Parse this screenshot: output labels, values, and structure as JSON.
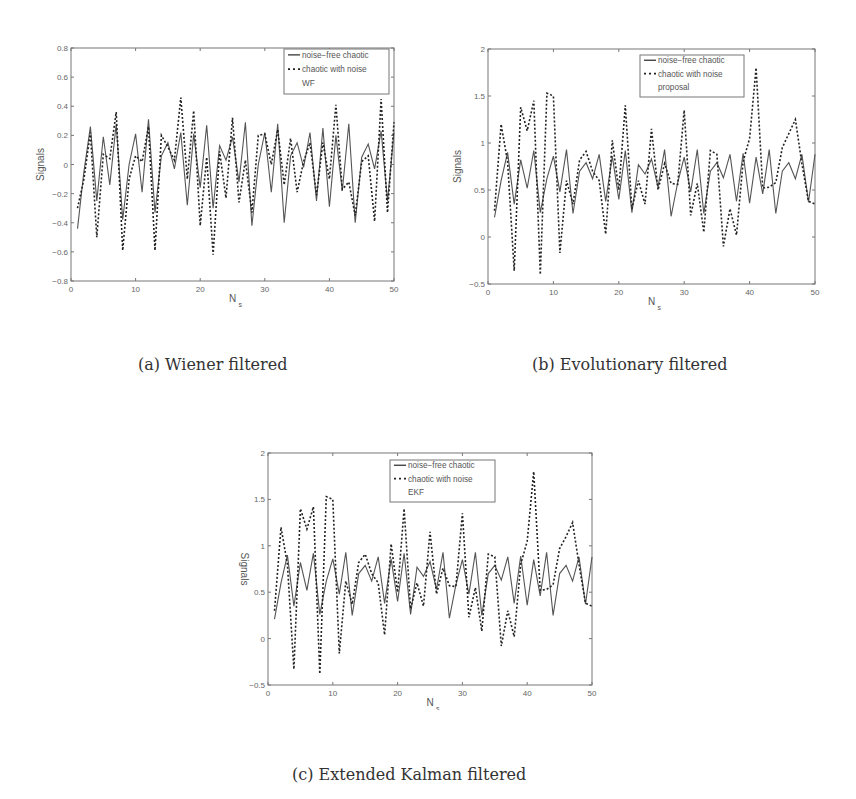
{
  "figure": {
    "captions": {
      "a": "(a) Wiener filtered",
      "b": "(b) Evolutionary filtered",
      "c": "(c) Extended Kalman filtered"
    }
  },
  "chart_data": [
    {
      "id": "a",
      "type": "line",
      "title": "",
      "xlabel": "N",
      "xlabel_sub": "s",
      "ylabel": "Signals",
      "xlim": [
        0,
        50
      ],
      "ylim": [
        -0.8,
        0.8
      ],
      "xticks": [
        0,
        10,
        20,
        30,
        40,
        50
      ],
      "yticks": [
        -0.8,
        -0.6,
        -0.4,
        -0.2,
        0,
        0.2,
        0.4,
        0.6,
        0.8
      ],
      "ytick_labels": [
        "−0.8",
        "−0.6",
        "−0.4",
        "−0.2",
        "0",
        "0.2",
        "0.4",
        "0.6",
        "0.8"
      ],
      "grid": false,
      "legend_position": "upper right",
      "legend": [
        "noise−free chaotic",
        "chaotic with noise",
        "WF"
      ],
      "x": [
        1,
        2,
        3,
        4,
        5,
        6,
        7,
        8,
        9,
        10,
        11,
        12,
        13,
        14,
        15,
        16,
        17,
        18,
        19,
        20,
        21,
        22,
        23,
        24,
        25,
        26,
        27,
        28,
        29,
        30,
        31,
        32,
        33,
        34,
        35,
        36,
        37,
        38,
        39,
        40,
        41,
        42,
        43,
        44,
        45,
        46,
        47,
        48,
        49,
        50
      ],
      "series": [
        {
          "name": "noise-free chaotic",
          "style": "solid",
          "values": [
            -0.44,
            -0.05,
            0.26,
            -0.25,
            0.19,
            -0.14,
            0.28,
            -0.38,
            0.0,
            0.21,
            -0.19,
            0.31,
            -0.33,
            0.06,
            0.15,
            -0.03,
            0.22,
            -0.28,
            0.21,
            -0.16,
            0.27,
            -0.3,
            0.13,
            0.03,
            0.19,
            -0.12,
            0.29,
            -0.42,
            0.0,
            0.22,
            -0.19,
            0.28,
            -0.4,
            0.06,
            0.15,
            -0.02,
            0.22,
            -0.25,
            0.25,
            -0.29,
            0.2,
            -0.18,
            0.28,
            -0.4,
            0.05,
            0.14,
            -0.03,
            0.23,
            -0.25,
            0.22
          ]
        },
        {
          "name": "chaotic with noise",
          "style": "dashed",
          "values": [
            -0.3,
            -0.1,
            0.22,
            -0.5,
            0.07,
            0.04,
            0.36,
            -0.59,
            -0.1,
            0.06,
            0.02,
            0.26,
            -0.59,
            0.2,
            0.12,
            0.03,
            0.46,
            -0.1,
            0.37,
            -0.42,
            0.05,
            -0.62,
            0.09,
            -0.23,
            0.32,
            -0.26,
            0.03,
            -0.33,
            0.2,
            0.21,
            0.0,
            0.24,
            -0.14,
            0.18,
            -0.19,
            0.02,
            0.15,
            -0.21,
            0.15,
            -0.1,
            0.41,
            -0.17,
            -0.12,
            -0.35,
            0.02,
            0.06,
            -0.39,
            0.45,
            -0.33,
            0.29
          ]
        }
      ]
    },
    {
      "id": "b",
      "type": "line",
      "title": "",
      "xlabel": "N",
      "xlabel_sub": "s",
      "ylabel": "Signals",
      "xlim": [
        0,
        50
      ],
      "ylim": [
        -0.5,
        2
      ],
      "xticks": [
        0,
        10,
        20,
        30,
        40,
        50
      ],
      "yticks": [
        -0.5,
        0,
        0.5,
        1,
        1.5,
        2
      ],
      "ytick_labels": [
        "−0.5",
        "0",
        "0.5",
        "1",
        "1.5",
        "2"
      ],
      "grid": false,
      "legend_position": "upper center-right",
      "legend": [
        "noise−free chaotic",
        "chaotic with noise",
        "proposal"
      ],
      "x": [
        1,
        2,
        3,
        4,
        5,
        6,
        7,
        8,
        9,
        10,
        11,
        12,
        13,
        14,
        15,
        16,
        17,
        18,
        19,
        20,
        21,
        22,
        23,
        24,
        25,
        26,
        27,
        28,
        29,
        30,
        31,
        32,
        33,
        34,
        35,
        36,
        37,
        38,
        39,
        40,
        41,
        42,
        43,
        44,
        45,
        46,
        47,
        48,
        49,
        50
      ],
      "series": [
        {
          "name": "noise-free chaotic",
          "style": "solid",
          "values": [
            0.21,
            0.6,
            0.9,
            0.35,
            0.82,
            0.52,
            0.92,
            0.26,
            0.62,
            0.86,
            0.48,
            0.93,
            0.25,
            0.7,
            0.79,
            0.62,
            0.88,
            0.38,
            0.86,
            0.4,
            0.92,
            0.26,
            0.77,
            0.67,
            0.83,
            0.53,
            0.93,
            0.22,
            0.58,
            0.85,
            0.48,
            0.93,
            0.25,
            0.7,
            0.79,
            0.63,
            0.88,
            0.38,
            0.89,
            0.36,
            0.85,
            0.46,
            0.93,
            0.25,
            0.7,
            0.79,
            0.62,
            0.88,
            0.37,
            0.88
          ]
        },
        {
          "name": "chaotic with noise",
          "style": "dashed",
          "values": [
            0.28,
            1.2,
            0.8,
            -0.36,
            1.38,
            1.13,
            1.45,
            -0.4,
            1.53,
            1.5,
            -0.17,
            0.6,
            0.35,
            0.82,
            0.91,
            0.7,
            0.6,
            0.03,
            1.03,
            0.5,
            1.4,
            0.3,
            0.6,
            0.35,
            1.15,
            0.5,
            0.78,
            0.57,
            0.56,
            1.35,
            0.23,
            0.57,
            0.05,
            0.92,
            0.88,
            -0.1,
            0.3,
            0.02,
            0.8,
            1.05,
            1.8,
            0.52,
            0.53,
            0.58,
            0.95,
            1.1,
            1.25,
            0.78,
            0.38,
            0.35
          ]
        }
      ]
    },
    {
      "id": "c",
      "type": "line",
      "title": "",
      "xlabel": "N",
      "xlabel_sub": "s",
      "ylabel": "Signals",
      "xlim": [
        0,
        50
      ],
      "ylim": [
        -0.5,
        2
      ],
      "xticks": [
        0,
        10,
        20,
        30,
        40,
        50
      ],
      "yticks": [
        -0.5,
        0,
        0.5,
        1,
        1.5,
        2
      ],
      "ytick_labels": [
        "−0.5",
        "0",
        "0.5",
        "1",
        "1.5",
        "2"
      ],
      "grid": false,
      "legend_position": "upper center-right",
      "legend": [
        "noise−free chaotic",
        "chaotic with noise",
        "EKF"
      ],
      "x": [
        1,
        2,
        3,
        4,
        5,
        6,
        7,
        8,
        9,
        10,
        11,
        12,
        13,
        14,
        15,
        16,
        17,
        18,
        19,
        20,
        21,
        22,
        23,
        24,
        25,
        26,
        27,
        28,
        29,
        30,
        31,
        32,
        33,
        34,
        35,
        36,
        37,
        38,
        39,
        40,
        41,
        42,
        43,
        44,
        45,
        46,
        47,
        48,
        49,
        50
      ],
      "series": [
        {
          "name": "noise-free chaotic",
          "style": "solid",
          "values": [
            0.21,
            0.6,
            0.9,
            0.35,
            0.82,
            0.52,
            0.92,
            0.26,
            0.62,
            0.86,
            0.48,
            0.93,
            0.25,
            0.7,
            0.79,
            0.62,
            0.88,
            0.38,
            0.86,
            0.4,
            0.92,
            0.26,
            0.77,
            0.67,
            0.83,
            0.53,
            0.93,
            0.22,
            0.58,
            0.85,
            0.48,
            0.93,
            0.25,
            0.7,
            0.79,
            0.63,
            0.88,
            0.38,
            0.89,
            0.36,
            0.85,
            0.46,
            0.93,
            0.25,
            0.7,
            0.79,
            0.62,
            0.88,
            0.37,
            0.88
          ]
        },
        {
          "name": "chaotic with noise",
          "style": "dashed",
          "values": [
            0.3,
            1.2,
            0.8,
            -0.33,
            1.4,
            1.18,
            1.42,
            -0.38,
            1.53,
            1.5,
            -0.16,
            0.62,
            0.37,
            0.82,
            0.91,
            0.7,
            0.6,
            0.04,
            1.02,
            0.5,
            1.4,
            0.32,
            0.6,
            0.35,
            1.15,
            0.48,
            0.76,
            0.57,
            0.56,
            1.35,
            0.23,
            0.55,
            0.08,
            0.91,
            0.88,
            -0.08,
            0.3,
            0.02,
            0.8,
            1.05,
            1.8,
            0.52,
            0.53,
            0.58,
            0.97,
            1.1,
            1.25,
            0.8,
            0.38,
            0.35
          ]
        }
      ]
    }
  ]
}
